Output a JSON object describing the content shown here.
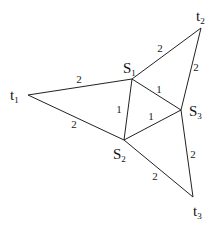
{
  "diagram": {
    "type": "weighted-graph",
    "nodes": [
      {
        "id": "t1",
        "base": "t",
        "sub": "1",
        "x": 28,
        "y": 95,
        "lx": 10,
        "ly": 100
      },
      {
        "id": "t2",
        "base": "t",
        "sub": "2",
        "x": 201,
        "y": 28,
        "lx": 196,
        "ly": 21
      },
      {
        "id": "t3",
        "base": "t",
        "sub": "3",
        "x": 193,
        "y": 197,
        "lx": 193,
        "ly": 216
      },
      {
        "id": "S1",
        "base": "S",
        "sub": "1",
        "x": 132,
        "y": 79,
        "lx": 123,
        "ly": 73
      },
      {
        "id": "S2",
        "base": "S",
        "sub": "2",
        "x": 124,
        "y": 140,
        "lx": 113,
        "ly": 159
      },
      {
        "id": "S3",
        "base": "S",
        "sub": "3",
        "x": 181,
        "y": 110,
        "lx": 189,
        "ly": 116
      }
    ],
    "edges": [
      {
        "from": "t1",
        "to": "S1",
        "weight": "2",
        "wx": 79,
        "wy": 83
      },
      {
        "from": "t1",
        "to": "S2",
        "weight": "2",
        "wx": 74,
        "wy": 128
      },
      {
        "from": "S1",
        "to": "t2",
        "weight": "2",
        "wx": 160,
        "wy": 52
      },
      {
        "from": "t2",
        "to": "S3",
        "weight": "2",
        "wx": 196,
        "wy": 71
      },
      {
        "from": "S1",
        "to": "S2",
        "weight": "1",
        "wx": 119,
        "wy": 113
      },
      {
        "from": "S1",
        "to": "S3",
        "weight": "1",
        "wx": 159,
        "wy": 93
      },
      {
        "from": "S2",
        "to": "S3",
        "weight": "1",
        "wx": 151,
        "wy": 120
      },
      {
        "from": "S2",
        "to": "t3",
        "weight": "2",
        "wx": 155,
        "wy": 180
      },
      {
        "from": "S3",
        "to": "t3",
        "weight": "2",
        "wx": 193,
        "wy": 158
      }
    ]
  }
}
